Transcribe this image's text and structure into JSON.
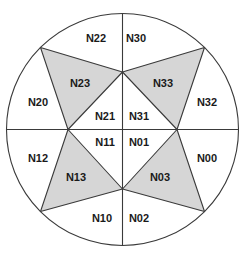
{
  "figure": {
    "width": 245,
    "height": 258,
    "stroke_width": 1.1,
    "label_font_size": 11,
    "colors": {
      "background": "#ffffff",
      "stroke": "#3a3a3a",
      "shaded_fill": "#d6d6d6",
      "region_fill": "#ffffff",
      "label": "#1a1a1a"
    },
    "circle": {
      "cx": 122.5,
      "cy": 129.5,
      "r": 116
    },
    "points": {
      "top": [
        122.5,
        13.5
      ],
      "bottom": [
        122.5,
        245.5
      ],
      "left": [
        6.5,
        129.5
      ],
      "right": [
        238.5,
        129.5
      ],
      "upper_left": [
        40.5,
        47.5
      ],
      "upper_right": [
        204.5,
        47.5
      ],
      "lower_left": [
        40.5,
        211.5
      ],
      "lower_right": [
        204.5,
        211.5
      ],
      "mid_top": [
        122.5,
        72
      ],
      "mid_bottom": [
        122.5,
        189
      ],
      "hub_left": [
        68,
        129.5
      ],
      "hub_right": [
        177,
        129.5
      ]
    },
    "diameters": [
      {
        "name": "vertical",
        "from": "top",
        "to": "bottom"
      },
      {
        "name": "horizontal",
        "from": "left",
        "to": "right"
      }
    ],
    "triangles": [
      {
        "label": "N23",
        "shaded": true,
        "vertices": [
          "upper_left",
          "mid_top",
          "hub_left"
        ],
        "label_pos": [
          80,
          83
        ]
      },
      {
        "label": "N33",
        "shaded": true,
        "vertices": [
          "upper_right",
          "mid_top",
          "hub_right"
        ],
        "label_pos": [
          163,
          83
        ]
      },
      {
        "label": "N13",
        "shaded": true,
        "vertices": [
          "lower_left",
          "mid_bottom",
          "hub_left"
        ],
        "label_pos": [
          76,
          177
        ]
      },
      {
        "label": "N03",
        "shaded": true,
        "vertices": [
          "lower_right",
          "mid_bottom",
          "hub_right"
        ],
        "label_pos": [
          160,
          177
        ]
      }
    ],
    "region_labels": [
      {
        "label": "N22",
        "pos": [
          96,
          38
        ]
      },
      {
        "label": "N30",
        "pos": [
          136,
          38
        ]
      },
      {
        "label": "N20",
        "pos": [
          38,
          102
        ]
      },
      {
        "label": "N32",
        "pos": [
          207,
          102
        ]
      },
      {
        "label": "N21",
        "pos": [
          105,
          116
        ]
      },
      {
        "label": "N31",
        "pos": [
          139,
          116
        ]
      },
      {
        "label": "N11",
        "pos": [
          105,
          142
        ]
      },
      {
        "label": "N01",
        "pos": [
          139,
          142
        ]
      },
      {
        "label": "N12",
        "pos": [
          38,
          158
        ]
      },
      {
        "label": "N00",
        "pos": [
          207,
          158
        ]
      },
      {
        "label": "N10",
        "pos": [
          102,
          218
        ]
      },
      {
        "label": "N02",
        "pos": [
          139,
          218
        ]
      }
    ]
  }
}
